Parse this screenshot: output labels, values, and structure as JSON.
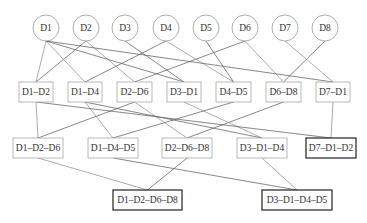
{
  "diagram": {
    "type": "lattice",
    "leaf_nodes": [
      {
        "id": "D1",
        "label": "D1",
        "cx": 46,
        "cy": 28
      },
      {
        "id": "D2",
        "label": "D2",
        "cx": 86,
        "cy": 28
      },
      {
        "id": "D3",
        "label": "D3",
        "cx": 125,
        "cy": 28
      },
      {
        "id": "D4",
        "label": "D4",
        "cx": 166,
        "cy": 28
      },
      {
        "id": "D5",
        "label": "D5",
        "cx": 206,
        "cy": 28
      },
      {
        "id": "D6",
        "label": "D6",
        "cx": 245,
        "cy": 28
      },
      {
        "id": "D7",
        "label": "D7",
        "cx": 285,
        "cy": 28
      },
      {
        "id": "D8",
        "label": "D8",
        "cx": 325,
        "cy": 28
      }
    ],
    "circle_radius": 13,
    "level2": [
      {
        "id": "D1-D2",
        "label": "D1–D2",
        "x": 19,
        "y": 82,
        "w": 34,
        "h": 20
      },
      {
        "id": "D1-D4",
        "label": "D1–D4",
        "x": 68,
        "y": 82,
        "w": 34,
        "h": 20
      },
      {
        "id": "D2-D6",
        "label": "D2–D6",
        "x": 117,
        "y": 82,
        "w": 35,
        "h": 20
      },
      {
        "id": "D3-D1",
        "label": "D3–D1",
        "x": 167,
        "y": 82,
        "w": 34,
        "h": 20
      },
      {
        "id": "D4-D5",
        "label": "D4–D5",
        "x": 216,
        "y": 82,
        "w": 35,
        "h": 20
      },
      {
        "id": "D6-D8",
        "label": "D6–D8",
        "x": 266,
        "y": 82,
        "w": 35,
        "h": 20
      },
      {
        "id": "D7-D1",
        "label": "D7–D1",
        "x": 316,
        "y": 82,
        "w": 34,
        "h": 20
      }
    ],
    "level3": [
      {
        "id": "D1-D2-D6",
        "label": "D1–D2–D6",
        "x": 13,
        "y": 138,
        "w": 50,
        "h": 20,
        "final": false
      },
      {
        "id": "D1-D4-D5",
        "label": "D1–D4–D5",
        "x": 88,
        "y": 138,
        "w": 50,
        "h": 20,
        "final": false
      },
      {
        "id": "D2-D6-D8",
        "label": "D2–D6–D8",
        "x": 162,
        "y": 138,
        "w": 50,
        "h": 20,
        "final": false
      },
      {
        "id": "D3-D1-D4",
        "label": "D3–D1–D4",
        "x": 237,
        "y": 138,
        "w": 50,
        "h": 20,
        "final": false
      },
      {
        "id": "D7-D1-D2",
        "label": "D7–D1–D2",
        "x": 306,
        "y": 138,
        "w": 50,
        "h": 20,
        "final": true
      }
    ],
    "level4": [
      {
        "id": "D1-D2-D6-D8",
        "label": "D1–D2–D6–D8",
        "x": 113,
        "y": 190,
        "w": 69,
        "h": 20,
        "final": true
      },
      {
        "id": "D3-D1-D4-D5",
        "label": "D3–D1–D4–D5",
        "x": 262,
        "y": 190,
        "w": 70,
        "h": 20,
        "final": true
      }
    ],
    "edges": [
      {
        "from": "D1",
        "to": "D1-D2",
        "dark": false
      },
      {
        "from": "D2",
        "to": "D1-D2",
        "dark": true
      },
      {
        "from": "D1",
        "to": "D1-D4",
        "dark": false
      },
      {
        "from": "D4",
        "to": "D1-D4",
        "dark": true
      },
      {
        "from": "D2",
        "to": "D2-D6",
        "dark": false
      },
      {
        "from": "D6",
        "to": "D2-D6",
        "dark": true
      },
      {
        "from": "D3",
        "to": "D3-D1",
        "dark": true
      },
      {
        "from": "D1",
        "to": "D3-D1",
        "dark": true
      },
      {
        "from": "D4",
        "to": "D4-D5",
        "dark": false
      },
      {
        "from": "D5",
        "to": "D4-D5",
        "dark": true
      },
      {
        "from": "D6",
        "to": "D6-D8",
        "dark": false
      },
      {
        "from": "D8",
        "to": "D6-D8",
        "dark": true
      },
      {
        "from": "D7",
        "to": "D7-D1",
        "dark": false
      },
      {
        "from": "D1",
        "to": "D7-D1",
        "dark": true
      },
      {
        "from": "D1-D2",
        "to": "D1-D2-D6",
        "dark": false
      },
      {
        "from": "D2-D6",
        "to": "D1-D2-D6",
        "dark": true
      },
      {
        "from": "D1-D4",
        "to": "D1-D4-D5",
        "dark": false
      },
      {
        "from": "D4-D5",
        "to": "D1-D4-D5",
        "dark": true
      },
      {
        "from": "D2-D6",
        "to": "D2-D6-D8",
        "dark": false
      },
      {
        "from": "D6-D8",
        "to": "D2-D6-D8",
        "dark": true
      },
      {
        "from": "D3-D1",
        "to": "D3-D1-D4",
        "dark": false
      },
      {
        "from": "D1-D4",
        "to": "D3-D1-D4",
        "dark": true
      },
      {
        "from": "D7-D1",
        "to": "D7-D1-D2",
        "dark": false
      },
      {
        "from": "D1-D2",
        "to": "D7-D1-D2",
        "dark": true
      },
      {
        "from": "D1-D2-D6",
        "to": "D1-D2-D6-D8",
        "dark": false
      },
      {
        "from": "D2-D6-D8",
        "to": "D1-D2-D6-D8",
        "dark": true
      },
      {
        "from": "D3-D1-D4",
        "to": "D3-D1-D4-D5",
        "dark": false
      },
      {
        "from": "D1-D4-D5",
        "to": "D3-D1-D4-D5",
        "dark": true
      }
    ]
  }
}
